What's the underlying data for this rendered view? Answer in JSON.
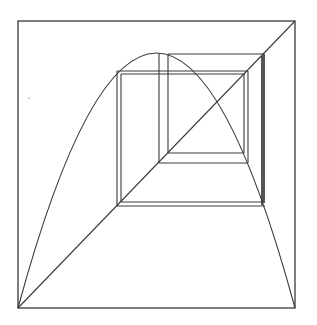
{
  "diagram": {
    "type": "cobweb-plot",
    "colors": {
      "background": "#ffffff",
      "stroke": "#3a3a3a"
    },
    "frame": {
      "x": 18,
      "y": 21,
      "width": 277,
      "height": 287
    },
    "curve": {
      "kind": "parabola",
      "start": [
        18,
        308
      ],
      "peak": [
        156.5,
        53
      ],
      "end": [
        295,
        308
      ]
    },
    "diagonal": {
      "from": [
        18,
        308
      ],
      "to": [
        295,
        21
      ]
    },
    "cobweb_segments": [
      {
        "x1": 117,
        "y1": 206,
        "x2": 117,
        "y2": 71
      },
      {
        "x1": 121,
        "y1": 202,
        "x2": 121,
        "y2": 74
      },
      {
        "x1": 117,
        "y1": 71,
        "x2": 248,
        "y2": 71
      },
      {
        "x1": 121,
        "y1": 74,
        "x2": 245,
        "y2": 74
      },
      {
        "x1": 248,
        "y1": 71,
        "x2": 248,
        "y2": 163
      },
      {
        "x1": 244,
        "y1": 74,
        "x2": 244,
        "y2": 153
      },
      {
        "x1": 159,
        "y1": 53,
        "x2": 159,
        "y2": 163
      },
      {
        "x1": 168,
        "y1": 54,
        "x2": 168,
        "y2": 153
      },
      {
        "x1": 159,
        "y1": 163,
        "x2": 248,
        "y2": 163
      },
      {
        "x1": 168,
        "y1": 153,
        "x2": 244,
        "y2": 153
      },
      {
        "x1": 168,
        "y1": 54,
        "x2": 264,
        "y2": 54
      },
      {
        "x1": 264,
        "y1": 54,
        "x2": 264,
        "y2": 203
      },
      {
        "x1": 262,
        "y1": 56,
        "x2": 262,
        "y2": 205
      },
      {
        "x1": 117,
        "y1": 206,
        "x2": 265,
        "y2": 206
      },
      {
        "x1": 121,
        "y1": 202,
        "x2": 262,
        "y2": 202
      }
    ]
  }
}
